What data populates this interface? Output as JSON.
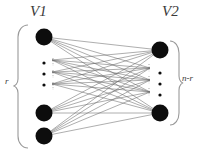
{
  "figure": {
    "type": "bipartite-graph-diagram",
    "colors": {
      "node": "#0d0d0d",
      "edge": "#6b6b6b",
      "brace": "#9a9a9a",
      "text": "#3a3a3a",
      "background": "#ffffff"
    },
    "labels": {
      "left_set": "V1",
      "right_set": "V2",
      "left_size": "r",
      "right_size": "n-r"
    },
    "ellipsis": {
      "glyph": "⋮",
      "left_count": 3,
      "right_count": 3
    },
    "left_nodes": [
      {
        "id": "v1-1",
        "cx": 44,
        "cy": 37,
        "r": 8.5
      },
      {
        "id": "v1-2",
        "cx": 44,
        "cy": 113,
        "r": 8.5
      },
      {
        "id": "v1-3",
        "cx": 44,
        "cy": 136,
        "r": 8.5
      }
    ],
    "right_nodes": [
      {
        "id": "v2-1",
        "cx": 160,
        "cy": 50,
        "r": 8.5
      },
      {
        "id": "v2-2",
        "cx": 160,
        "cy": 113,
        "r": 8.5
      }
    ],
    "implied_left_nodes": [
      {
        "id": "v1-hidden-a",
        "cx": 44,
        "cy": 63
      },
      {
        "id": "v1-hidden-b",
        "cx": 44,
        "cy": 74
      },
      {
        "id": "v1-hidden-c",
        "cx": 44,
        "cy": 85
      }
    ],
    "implied_right_nodes": [
      {
        "id": "v2-hidden-a",
        "cx": 160,
        "cy": 73
      },
      {
        "id": "v2-hidden-b",
        "cx": 160,
        "cy": 84
      },
      {
        "id": "v2-hidden-c",
        "cx": 160,
        "cy": 95
      }
    ],
    "edge_endpoints_left": [
      {
        "x": 44,
        "y": 37
      },
      {
        "x": 52,
        "y": 60
      },
      {
        "x": 52,
        "y": 72
      },
      {
        "x": 52,
        "y": 84
      },
      {
        "x": 44,
        "y": 113
      },
      {
        "x": 44,
        "y": 136
      }
    ],
    "edge_endpoints_right": [
      {
        "x": 160,
        "y": 50
      },
      {
        "x": 150,
        "y": 68
      },
      {
        "x": 150,
        "y": 80
      },
      {
        "x": 150,
        "y": 92
      },
      {
        "x": 160,
        "y": 113
      }
    ],
    "braces": {
      "left": {
        "x_tip": 18,
        "x_body": 28,
        "y_top": 25,
        "y_bottom": 148,
        "y_mid": 86
      },
      "right": {
        "x_tip": 179,
        "x_body": 170,
        "y_top": 41,
        "y_bottom": 125,
        "y_mid": 83
      }
    }
  }
}
